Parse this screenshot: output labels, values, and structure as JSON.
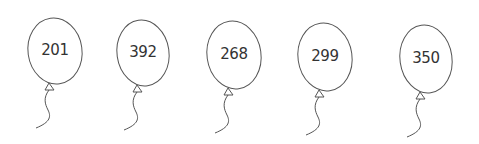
{
  "balloons": [
    {
      "value": "201",
      "cx": 55,
      "cy": 51,
      "rx": 27,
      "ry": 33,
      "knot_x": 50
    },
    {
      "value": "392",
      "cx": 143,
      "cy": 53,
      "rx": 26,
      "ry": 33,
      "knot_x": 138
    },
    {
      "value": "268",
      "cx": 234,
      "cy": 55,
      "rx": 27,
      "ry": 34,
      "knot_x": 229
    },
    {
      "value": "299",
      "cx": 325,
      "cy": 57,
      "rx": 27,
      "ry": 34,
      "knot_x": 320
    },
    {
      "value": "350",
      "cx": 426,
      "cy": 59,
      "rx": 26,
      "ry": 34,
      "knot_x": 421
    }
  ],
  "colors": {
    "stroke": "#555555",
    "text": "#333333",
    "background": "#ffffff"
  }
}
